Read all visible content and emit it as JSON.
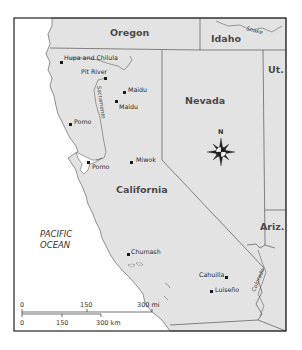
{
  "map": {
    "colors": {
      "land": "#e3e3e3",
      "water": "#ffffff",
      "border": "#555555",
      "frame": "#222222",
      "marker": "#1a1a1a"
    },
    "states": [
      {
        "id": "oregon",
        "label": "Oregon"
      },
      {
        "id": "idaho",
        "label": "Idaho"
      },
      {
        "id": "nevada",
        "label": "Nevada"
      },
      {
        "id": "utah",
        "label": "Ut."
      },
      {
        "id": "california",
        "label": "California"
      },
      {
        "id": "arizona",
        "label": "Ariz."
      }
    ],
    "ocean": {
      "line1": "PACIFIC",
      "line2": "OCEAN"
    },
    "rivers": [
      {
        "id": "snake",
        "label": "Snake"
      },
      {
        "id": "sacramento",
        "label": "Sacramento"
      },
      {
        "id": "colorado",
        "label": "Colorado"
      }
    ],
    "tribes": [
      {
        "id": "hupa-chilula",
        "label": "Hupa and Chilula"
      },
      {
        "id": "pit-river",
        "label": "Pit River"
      },
      {
        "id": "maidu-1",
        "label": "Maidu"
      },
      {
        "id": "maidu-2",
        "label": "Maidu"
      },
      {
        "id": "pomo-1",
        "label": "Pomo"
      },
      {
        "id": "pomo-2",
        "label": "Pomo"
      },
      {
        "id": "miwok",
        "label": "Miwok"
      },
      {
        "id": "chumash",
        "label": "Chumash"
      },
      {
        "id": "cahuilla",
        "label": "Cahuilla"
      },
      {
        "id": "luiseno",
        "label": "Luiseño"
      }
    ],
    "compass": {
      "label": "N"
    },
    "scale": {
      "mi": {
        "ticks": [
          "0",
          "150",
          "300 mi"
        ]
      },
      "km": {
        "ticks": [
          "0",
          "150",
          "300 km"
        ]
      }
    }
  }
}
